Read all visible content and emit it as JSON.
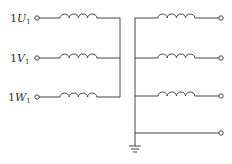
{
  "diagram": {
    "type": "circuit-schematic",
    "primary_terminals": [
      {
        "prefix": "1",
        "letter": "U",
        "sub": "1"
      },
      {
        "prefix": "1",
        "letter": "V",
        "sub": "1"
      },
      {
        "prefix": "1",
        "letter": "W",
        "sub": "1"
      }
    ],
    "secondary_outputs": 4,
    "colors": {
      "line": "#444444",
      "text": "#333333",
      "background": "#ffffff"
    }
  }
}
